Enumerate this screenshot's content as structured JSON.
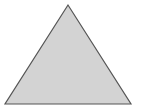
{
  "figure": {
    "shape": "triangle",
    "fill": "#d3d3d3",
    "stroke": "#555555",
    "background": "#ffffff",
    "vertices": [
      [
        68,
        5
      ],
      [
        5,
        104
      ],
      [
        131,
        104
      ]
    ]
  }
}
